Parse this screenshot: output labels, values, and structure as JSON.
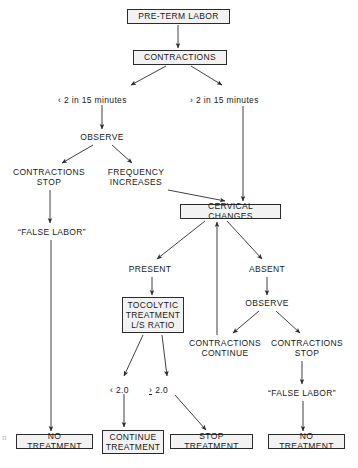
{
  "diagram": {
    "type": "flowchart",
    "width": 358,
    "height": 468,
    "background_color": "#ffffff",
    "line_color": "#2b2b2b",
    "text_color": "#1a1a1a",
    "box_fill_color": "#f2f2f2",
    "nodes": [
      {
        "id": "pre_term_labor",
        "label": "PRE-TERM LABOR",
        "style": "boxed",
        "x": 127,
        "y": 9,
        "w": 103,
        "h": 15
      },
      {
        "id": "contractions",
        "label": "CONTRACTIONS",
        "style": "boxed",
        "x": 133,
        "y": 50,
        "w": 94,
        "h": 15
      },
      {
        "id": "observe_left",
        "label": "OBSERVE",
        "style": "plain",
        "x": 72,
        "y": 131,
        "w": 60,
        "h": 12
      },
      {
        "id": "contractions_stop_left",
        "label": "CONTRACTIONS\nSTOP",
        "style": "plain",
        "x": 8,
        "y": 166,
        "w": 82,
        "h": 22
      },
      {
        "id": "frequency_increases",
        "label": "FREQUENCY\nINCREASES",
        "style": "plain",
        "x": 100,
        "y": 166,
        "w": 72,
        "h": 22
      },
      {
        "id": "false_labor_left",
        "label": "“FALSE LABOR”",
        "style": "plain",
        "x": 11,
        "y": 226,
        "w": 82,
        "h": 12
      },
      {
        "id": "cervical_changes",
        "label": "CERVICAL CHANGES",
        "style": "boxed",
        "x": 180,
        "y": 204,
        "w": 101,
        "h": 15
      },
      {
        "id": "present",
        "label": "PRESENT",
        "style": "plain",
        "x": 121,
        "y": 263,
        "w": 58,
        "h": 12
      },
      {
        "id": "absent",
        "label": "ABSENT",
        "style": "plain",
        "x": 242,
        "y": 263,
        "w": 50,
        "h": 12
      },
      {
        "id": "tocolytic",
        "label": "TOCOLYTIC\nTREATMENT\nL/S RATIO",
        "style": "boxed",
        "x": 122,
        "y": 297,
        "w": 62,
        "h": 36
      },
      {
        "id": "observe_right",
        "label": "OBSERVE",
        "style": "plain",
        "x": 237,
        "y": 297,
        "w": 60,
        "h": 12
      },
      {
        "id": "contractions_continue",
        "label": "CONTRACTIONS\nCONTINUE",
        "style": "plain",
        "x": 186,
        "y": 337,
        "w": 78,
        "h": 22
      },
      {
        "id": "contractions_stop_right",
        "label": "CONTRACTIONS\nSTOP",
        "style": "plain",
        "x": 266,
        "y": 337,
        "w": 82,
        "h": 22
      },
      {
        "id": "false_labor_right",
        "label": "“FALSE LABOR”",
        "style": "plain",
        "x": 261,
        "y": 387,
        "w": 82,
        "h": 12
      },
      {
        "id": "no_treatment_left",
        "label": "NO TREATMENT",
        "style": "boxed",
        "x": 16,
        "y": 434,
        "w": 77,
        "h": 15
      },
      {
        "id": "continue_treatment",
        "label": "CONTINUE\nTREATMENT",
        "style": "boxed",
        "x": 102,
        "y": 430,
        "w": 62,
        "h": 24
      },
      {
        "id": "stop_treatment",
        "label": "STOP TREATMENT",
        "style": "boxed",
        "x": 170,
        "y": 434,
        "w": 83,
        "h": 15
      },
      {
        "id": "no_treatment_right",
        "label": "NO TREATMENT",
        "style": "boxed",
        "x": 268,
        "y": 434,
        "w": 77,
        "h": 15
      }
    ],
    "edge_labels": [
      {
        "id": "lt_2_in_15",
        "text": "‹ 2 in 15 minutes",
        "x": 58,
        "y": 95
      },
      {
        "id": "gt_2_in_15",
        "text": "› 2 in 15 minutes",
        "x": 190,
        "y": 95
      },
      {
        "id": "lt_2_0",
        "text": "‹ 2.0",
        "x": 110,
        "y": 385
      },
      {
        "id": "ge_2_0_sign",
        "text": "›",
        "x": 149,
        "y": 385
      },
      {
        "id": "ge_2_0_num",
        "text": "2.0",
        "x": 160,
        "y": 385
      }
    ],
    "edges": [
      {
        "from": "pre_term_labor",
        "to": "contractions",
        "kind": "arrow-down"
      },
      {
        "from": "contractions",
        "to": "lt_2_in_15",
        "kind": "arrow-diagonal-left"
      },
      {
        "from": "contractions",
        "to": "gt_2_in_15",
        "kind": "arrow-diagonal-right"
      },
      {
        "from": "lt_2_in_15",
        "to": "observe_left",
        "kind": "arrow-down"
      },
      {
        "from": "observe_left",
        "to": "contractions_stop_left",
        "kind": "arrow-diagonal-left"
      },
      {
        "from": "observe_left",
        "to": "frequency_increases",
        "kind": "arrow-diagonal-right"
      },
      {
        "from": "contractions_stop_left",
        "to": "false_labor_left",
        "kind": "arrow-down"
      },
      {
        "from": "false_labor_left",
        "to": "no_treatment_left",
        "kind": "arrow-down-long"
      },
      {
        "from": "frequency_increases",
        "to": "cervical_changes",
        "kind": "arrow-diagonal-right"
      },
      {
        "from": "gt_2_in_15",
        "to": "cervical_changes",
        "kind": "arrow-down-long"
      },
      {
        "from": "cervical_changes",
        "to": "present",
        "kind": "arrow-diagonal-left"
      },
      {
        "from": "cervical_changes",
        "to": "absent",
        "kind": "arrow-diagonal-right"
      },
      {
        "from": "present",
        "to": "tocolytic",
        "kind": "arrow-down"
      },
      {
        "from": "absent",
        "to": "observe_right",
        "kind": "arrow-down"
      },
      {
        "from": "observe_right",
        "to": "contractions_continue",
        "kind": "arrow-diagonal-left"
      },
      {
        "from": "observe_right",
        "to": "contractions_stop_right",
        "kind": "arrow-diagonal-right"
      },
      {
        "from": "contractions_continue",
        "to": "cervical_changes",
        "kind": "arrow-up-long"
      },
      {
        "from": "contractions_stop_right",
        "to": "false_labor_right",
        "kind": "arrow-down"
      },
      {
        "from": "false_labor_right",
        "to": "no_treatment_right",
        "kind": "arrow-down-long"
      },
      {
        "from": "tocolytic",
        "to": "lt_2_0",
        "kind": "arrow-diagonal-left"
      },
      {
        "from": "tocolytic",
        "to": "ge_2_0_num",
        "kind": "arrow-diagonal-right"
      },
      {
        "from": "lt_2_0",
        "to": "continue_treatment",
        "kind": "arrow-down"
      },
      {
        "from": "ge_2_0_num",
        "to": "stop_treatment",
        "kind": "arrow-diagonal-right"
      }
    ]
  }
}
